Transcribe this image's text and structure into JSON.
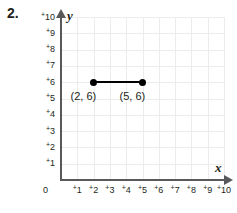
{
  "problem": {
    "number": "2."
  },
  "chart_data": {
    "type": "scatter",
    "title": "",
    "xlabel": "x",
    "ylabel": "y",
    "xlim": [
      0,
      10
    ],
    "ylim": [
      0,
      10
    ],
    "grid": true,
    "legend": null,
    "x_ticks": [
      "0",
      "⁺1",
      "⁺2",
      "⁺3",
      "⁺4",
      "⁺5",
      "⁺6",
      "⁺7",
      "⁺8",
      "⁺9",
      "⁺10"
    ],
    "y_ticks": [
      "0",
      "⁺1",
      "⁺2",
      "⁺3",
      "⁺4",
      "⁺5",
      "⁺6",
      "⁺7",
      "⁺8",
      "⁺9",
      "⁺10"
    ],
    "x_tick_numbers": [
      1,
      2,
      3,
      4,
      5,
      6,
      7,
      8,
      9,
      10
    ],
    "y_tick_numbers": [
      1,
      2,
      3,
      4,
      5,
      6,
      7,
      8,
      9,
      10
    ],
    "origin_label": "0",
    "points": [
      {
        "x": 2,
        "y": 6,
        "label": "(2, 6)"
      },
      {
        "x": 5,
        "y": 6,
        "label": "(5, 6)"
      }
    ],
    "segments": [
      {
        "from": [
          2,
          6
        ],
        "to": [
          5,
          6
        ]
      }
    ],
    "colors": {
      "point": "#000000",
      "segment": "#000000",
      "axis": "#58595b",
      "gridline": "#ececed",
      "text": "#231f20"
    }
  }
}
